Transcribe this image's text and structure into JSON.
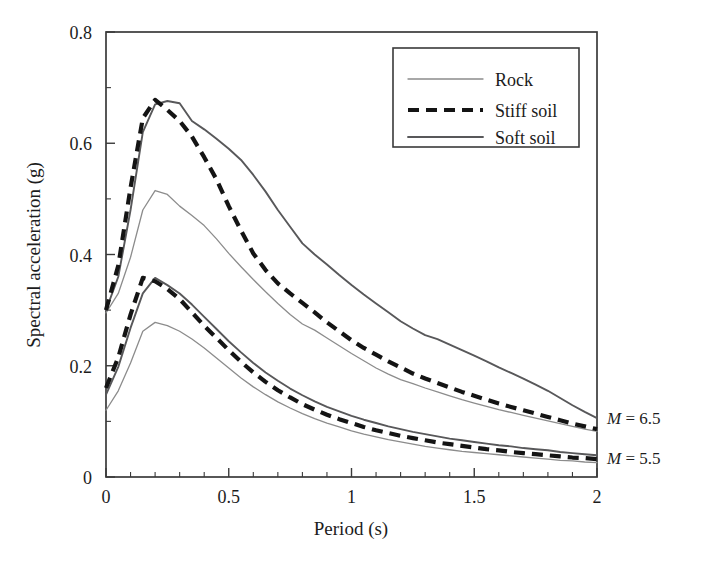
{
  "chart_data": {
    "type": "line",
    "title": "",
    "xlabel": "Period (s)",
    "ylabel": "Spectral acceleration (g)",
    "xlim": [
      0,
      2
    ],
    "ylim": [
      0,
      0.8
    ],
    "xticks": [
      "0",
      "0.5",
      "1",
      "1.5",
      "2"
    ],
    "xtick_values": [
      0,
      0.5,
      1,
      1.5,
      2
    ],
    "yticks": [
      "0",
      "0.2",
      "0.4",
      "0.6",
      "0.8"
    ],
    "ytick_values": [
      0,
      0.2,
      0.4,
      0.6,
      0.8
    ],
    "minor_tick_step_x": 0.1,
    "minor_tick_step_y": 0.1,
    "grid": false,
    "legend_position": "top-right",
    "legend_entries": [
      "Rock",
      "Stiff soil",
      "Soft soil"
    ],
    "annotations": [
      {
        "text": "M = 6.5",
        "italic_prefix": "M",
        "rest": " = 6.5",
        "x": 2.0,
        "y": 0.105
      },
      {
        "text": "M = 5.5",
        "italic_prefix": "M",
        "rest": " = 5.5",
        "x": 2.0,
        "y": 0.042
      }
    ],
    "x": [
      0,
      0.05,
      0.1,
      0.15,
      0.2,
      0.25,
      0.3,
      0.35,
      0.4,
      0.45,
      0.5,
      0.55,
      0.6,
      0.65,
      0.7,
      0.75,
      0.8,
      0.85,
      0.9,
      0.95,
      1.0,
      1.05,
      1.1,
      1.15,
      1.2,
      1.25,
      1.3,
      1.35,
      1.4,
      1.45,
      1.5,
      1.55,
      1.6,
      1.65,
      1.7,
      1.75,
      1.8,
      1.85,
      1.9,
      1.95,
      2.0
    ],
    "series": [
      {
        "name": "Rock",
        "magnitude": "M = 6.5",
        "style": "thin-solid",
        "color": "#8c8c8c",
        "values": [
          0.295,
          0.33,
          0.395,
          0.48,
          0.515,
          0.508,
          0.487,
          0.47,
          0.452,
          0.428,
          0.402,
          0.378,
          0.355,
          0.333,
          0.312,
          0.292,
          0.275,
          0.264,
          0.25,
          0.236,
          0.222,
          0.209,
          0.196,
          0.185,
          0.175,
          0.168,
          0.16,
          0.153,
          0.146,
          0.139,
          0.133,
          0.127,
          0.121,
          0.116,
          0.111,
          0.106,
          0.101,
          0.096,
          0.091,
          0.086,
          0.082
        ]
      },
      {
        "name": "Stiff soil",
        "magnitude": "M = 6.5",
        "style": "bold-dashed",
        "color": "#141414",
        "values": [
          0.3,
          0.38,
          0.52,
          0.645,
          0.678,
          0.66,
          0.64,
          0.612,
          0.575,
          0.535,
          0.487,
          0.443,
          0.402,
          0.372,
          0.348,
          0.33,
          0.313,
          0.296,
          0.278,
          0.262,
          0.246,
          0.232,
          0.22,
          0.208,
          0.197,
          0.186,
          0.177,
          0.169,
          0.161,
          0.153,
          0.146,
          0.139,
          0.132,
          0.126,
          0.12,
          0.114,
          0.108,
          0.102,
          0.096,
          0.091,
          0.086
        ]
      },
      {
        "name": "Soft soil",
        "magnitude": "M = 6.5",
        "style": "medium-solid",
        "color": "#58585a",
        "values": [
          0.3,
          0.36,
          0.48,
          0.62,
          0.67,
          0.676,
          0.672,
          0.64,
          0.625,
          0.608,
          0.59,
          0.57,
          0.543,
          0.513,
          0.48,
          0.45,
          0.42,
          0.4,
          0.382,
          0.363,
          0.345,
          0.328,
          0.312,
          0.296,
          0.28,
          0.267,
          0.255,
          0.248,
          0.238,
          0.228,
          0.218,
          0.208,
          0.197,
          0.187,
          0.177,
          0.166,
          0.155,
          0.142,
          0.129,
          0.117,
          0.106
        ]
      },
      {
        "name": "Rock",
        "magnitude": "M = 5.5",
        "style": "thin-solid",
        "color": "#8c8c8c",
        "values": [
          0.12,
          0.155,
          0.205,
          0.262,
          0.278,
          0.272,
          0.262,
          0.248,
          0.232,
          0.214,
          0.196,
          0.178,
          0.162,
          0.148,
          0.135,
          0.124,
          0.114,
          0.105,
          0.097,
          0.09,
          0.083,
          0.077,
          0.072,
          0.067,
          0.063,
          0.059,
          0.055,
          0.052,
          0.049,
          0.046,
          0.044,
          0.042,
          0.04,
          0.038,
          0.036,
          0.034,
          0.032,
          0.03,
          0.029,
          0.027,
          0.026
        ]
      },
      {
        "name": "Stiff soil",
        "magnitude": "M = 5.5",
        "style": "bold-dashed",
        "color": "#141414",
        "values": [
          0.16,
          0.215,
          0.292,
          0.358,
          0.352,
          0.338,
          0.32,
          0.296,
          0.272,
          0.25,
          0.228,
          0.207,
          0.188,
          0.171,
          0.156,
          0.143,
          0.131,
          0.121,
          0.112,
          0.104,
          0.097,
          0.09,
          0.084,
          0.079,
          0.074,
          0.07,
          0.066,
          0.062,
          0.059,
          0.056,
          0.053,
          0.05,
          0.048,
          0.045,
          0.043,
          0.041,
          0.039,
          0.037,
          0.035,
          0.034,
          0.032
        ]
      },
      {
        "name": "Soft soil",
        "magnitude": "M = 5.5",
        "style": "medium-solid",
        "color": "#58585a",
        "values": [
          0.148,
          0.198,
          0.268,
          0.33,
          0.358,
          0.345,
          0.33,
          0.31,
          0.288,
          0.266,
          0.244,
          0.224,
          0.205,
          0.188,
          0.173,
          0.159,
          0.147,
          0.136,
          0.126,
          0.118,
          0.11,
          0.103,
          0.097,
          0.091,
          0.086,
          0.081,
          0.077,
          0.073,
          0.069,
          0.066,
          0.063,
          0.06,
          0.057,
          0.055,
          0.052,
          0.05,
          0.048,
          0.045,
          0.043,
          0.041,
          0.039
        ]
      }
    ]
  },
  "axes": {
    "x_label": "Period (s)",
    "y_label": "Spectral acceleration (g)",
    "x_ticks": [
      "0",
      "0.5",
      "1",
      "1.5",
      "2"
    ],
    "y_ticks": [
      "0.8",
      "0.6",
      "0.4",
      "0.2",
      "0"
    ]
  },
  "legend": {
    "items": [
      {
        "label": "Rock",
        "style": "thin-solid"
      },
      {
        "label": "Stiff soil",
        "style": "bold-dashed"
      },
      {
        "label": "Soft soil",
        "style": "medium-solid"
      }
    ]
  },
  "annotations": {
    "upper": {
      "m": "M",
      "rest": " = 6.5"
    },
    "lower": {
      "m": "M",
      "rest": " = 5.5"
    }
  }
}
